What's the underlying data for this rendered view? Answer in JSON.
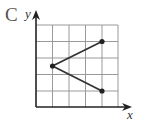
{
  "option_label": "C",
  "axes": {
    "x_label": "x",
    "y_label": "y"
  },
  "grid": {
    "columns": 5,
    "rows": 5
  },
  "colors": {
    "grid": "#888888",
    "axis": "#222222",
    "line": "#333333",
    "point": "#222222"
  },
  "points": [
    {
      "name": "left",
      "x": 1,
      "y": 2.5
    },
    {
      "name": "upper-right",
      "x": 4,
      "y": 4
    },
    {
      "name": "lower-right",
      "x": 4,
      "y": 1
    }
  ],
  "segments": [
    [
      "left",
      "upper-right"
    ],
    [
      "left",
      "lower-right"
    ]
  ]
}
